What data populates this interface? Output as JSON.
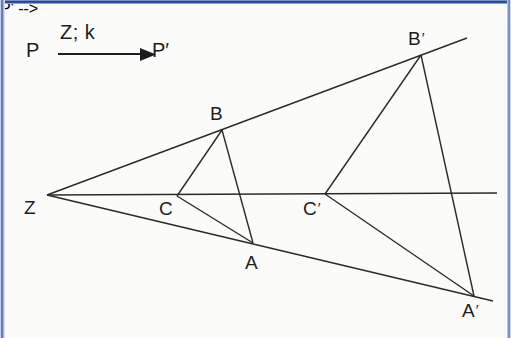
{
  "figure": {
    "background_color": "#fbfbf9",
    "line_color": "#2a2a2a",
    "border_color": "#2e4f9e"
  },
  "notation": {
    "source_point": "P",
    "map_label": "Z; k",
    "image_point": "P′",
    "arrow": "arrow-right-icon"
  },
  "points": [
    {
      "id": "Z",
      "label": "Z",
      "x": 47,
      "y": 195,
      "label_x": 24,
      "label_y": 198,
      "role": "center-of-dilation"
    },
    {
      "id": "A",
      "label": "A",
      "x": 253,
      "y": 243,
      "label_x": 245,
      "label_y": 253,
      "role": "preimage-vertex"
    },
    {
      "id": "B",
      "label": "B",
      "x": 222,
      "y": 130,
      "label_x": 210,
      "label_y": 104,
      "role": "preimage-vertex"
    },
    {
      "id": "C",
      "label": "C",
      "x": 177,
      "y": 196,
      "label_x": 159,
      "label_y": 199,
      "role": "preimage-vertex"
    },
    {
      "id": "A2",
      "label": "A′",
      "x": 474,
      "y": 296,
      "label_x": 462,
      "label_y": 300,
      "role": "image-vertex"
    },
    {
      "id": "B2",
      "label": "B′",
      "x": 421,
      "y": 55,
      "label_x": 408,
      "label_y": 28,
      "role": "image-vertex"
    },
    {
      "id": "C2",
      "label": "C′",
      "x": 325,
      "y": 194,
      "label_x": 303,
      "label_y": 198,
      "role": "image-vertex"
    }
  ],
  "rays_from_center": [
    {
      "name": "ray-Z-B-Bprime",
      "x1": 47,
      "y1": 195,
      "x2": 467,
      "y2": 38
    },
    {
      "name": "ray-Z-C-Cprime",
      "x1": 47,
      "y1": 195,
      "x2": 497,
      "y2": 193
    },
    {
      "name": "ray-Z-A-Aprime",
      "x1": 47,
      "y1": 195,
      "x2": 493,
      "y2": 301
    }
  ],
  "triangles": [
    {
      "name": "triangle-ABC",
      "vertices": [
        "A",
        "B",
        "C"
      ],
      "edges": [
        {
          "x1": 222,
          "y1": 130,
          "x2": 177,
          "y2": 196
        },
        {
          "x1": 177,
          "y1": 196,
          "x2": 253,
          "y2": 243
        },
        {
          "x1": 253,
          "y1": 243,
          "x2": 222,
          "y2": 130
        }
      ]
    },
    {
      "name": "triangle-A-prime-B-prime-C-prime",
      "vertices": [
        "A′",
        "B′",
        "C′"
      ],
      "edges": [
        {
          "x1": 421,
          "y1": 55,
          "x2": 325,
          "y2": 194
        },
        {
          "x1": 325,
          "y1": 194,
          "x2": 474,
          "y2": 296
        },
        {
          "x1": 474,
          "y1": 296,
          "x2": 421,
          "y2": 55
        }
      ]
    }
  ]
}
